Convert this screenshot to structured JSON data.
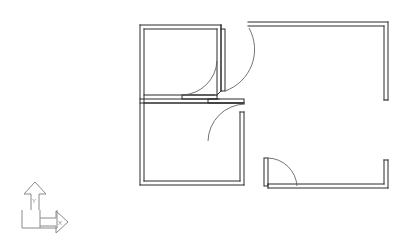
{
  "drawing": {
    "kind": "architectural-floor-plan",
    "title": "Floor Plan",
    "background_color": "#ffffff",
    "wall_color": "#2b2b2b",
    "arc_color": "#5a5a5a",
    "ucs_color": "#8a8a8a",
    "canvas": {
      "width": 417,
      "height": 247
    }
  },
  "ucs_icon": {
    "name": "ucs-axis-indicator",
    "x_label": "X",
    "y_label": "Y",
    "origin": {
      "x": 22,
      "y": 228
    },
    "x_arrow_end": {
      "x": 68,
      "y": 224
    },
    "y_arrow_end": {
      "x": 26,
      "y": 184
    }
  },
  "outline": {
    "description": "L-shaped building footprint drawn with double-line walls",
    "exterior_path": "M 140 25 L 248 25 L 248 22 L 388 22 L 388 100 L 388 160 L 388 188 L 268 188 L 268 185 L 140 185 Z",
    "wall_thickness": 4
  },
  "rooms": [
    {
      "name": "upper-left-room",
      "x": 140,
      "y": 25,
      "width": 79,
      "height": 73
    },
    {
      "name": "lower-left-room",
      "x": 140,
      "y": 102,
      "width": 102,
      "height": 83
    },
    {
      "name": "right-open-area",
      "x": 248,
      "y": 22,
      "width": 140,
      "height": 166
    }
  ],
  "walls": [
    {
      "name": "wall-left-exterior",
      "orientation": "vertical",
      "x1": 140,
      "y1": 25,
      "x2": 140,
      "y2": 185
    },
    {
      "name": "wall-top-left",
      "orientation": "horizontal",
      "x1": 140,
      "y1": 25,
      "x2": 219,
      "y2": 25
    },
    {
      "name": "wall-top-right",
      "orientation": "horizontal",
      "x1": 248,
      "y1": 22,
      "x2": 388,
      "y2": 22
    },
    {
      "name": "wall-right-upper",
      "orientation": "vertical",
      "x1": 388,
      "y1": 22,
      "x2": 388,
      "y2": 100
    },
    {
      "name": "wall-right-lower",
      "orientation": "vertical",
      "x1": 388,
      "y1": 160,
      "x2": 388,
      "y2": 188
    },
    {
      "name": "wall-bottom-left",
      "orientation": "horizontal",
      "x1": 140,
      "y1": 185,
      "x2": 242,
      "y2": 185
    },
    {
      "name": "wall-bottom-right",
      "orientation": "horizontal",
      "x1": 268,
      "y1": 188,
      "x2": 388,
      "y2": 188
    },
    {
      "name": "wall-divider-middle",
      "orientation": "horizontal",
      "x1": 140,
      "y1": 99,
      "x2": 242,
      "y2": 99
    },
    {
      "name": "wall-partition-right",
      "orientation": "vertical",
      "x1": 219,
      "y1": 25,
      "x2": 219,
      "y2": 99
    },
    {
      "name": "wall-lower-right-jamb",
      "orientation": "vertical",
      "x1": 242,
      "y1": 110,
      "x2": 242,
      "y2": 185
    }
  ],
  "openings": [
    {
      "name": "window-right-wall",
      "orientation": "vertical",
      "x": 388,
      "y_start": 100,
      "y_end": 160
    }
  ],
  "doors": [
    {
      "name": "door-upper-right",
      "hinge": {
        "x": 219,
        "y": 25
      },
      "panel": {
        "x1": 219,
        "y1": 27,
        "x2": 219,
        "y2": 68
      },
      "swing_radius": 43,
      "arc": "M 222 68 A 43 43 0 0 0 248 27",
      "swing_direction": "into-right-area"
    },
    {
      "name": "door-upper-left-room",
      "hinge": {
        "x": 215,
        "y": 97
      },
      "panel": {
        "x1": 184,
        "y1": 97,
        "x2": 215,
        "y2": 97
      },
      "swing_radius": 36,
      "arc": "M 184 96 A 36 36 0 0 0 215 62",
      "swing_direction": "into-upper-left-room"
    },
    {
      "name": "door-divider-wall",
      "hinge": {
        "x": 242,
        "y": 101
      },
      "panel": {
        "x1": 206,
        "y1": 101,
        "x2": 242,
        "y2": 101
      },
      "swing_radius": 36,
      "arc": "M 242 104 A 36 36 0 0 0 208 140",
      "swing_direction": "into-right-area"
    },
    {
      "name": "door-bottom-wall",
      "hinge": {
        "x": 268,
        "y": 160
      },
      "panel": {
        "x1": 268,
        "y1": 160,
        "x2": 268,
        "y2": 186
      },
      "swing_radius": 30,
      "arc": "M 270 160 A 30 30 0 0 1 298 186",
      "swing_direction": "into-right-area"
    }
  ]
}
